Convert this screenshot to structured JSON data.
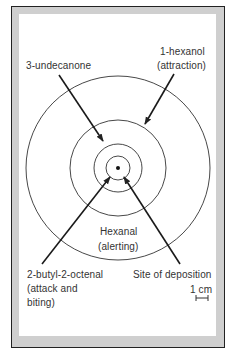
{
  "diagram": {
    "center": {
      "x": 118,
      "y": 168
    },
    "circle_radii": [
      12,
      24,
      48,
      92
    ],
    "colors": {
      "frame_band": "#cfcfcf",
      "frame_line": "#222222",
      "stroke": "#333333",
      "background": "#ffffff"
    },
    "labels": {
      "undecanone": "3-undecanone",
      "hexanol": "1-hexanol",
      "hexanol_effect": "(attraction)",
      "hexanal": "Hexanal",
      "hexanal_effect": "(alerting)",
      "butyloctenal": "2-butyl-2-octenal",
      "butyloctenal_effect_1": "(attack and",
      "butyloctenal_effect_2": "biting)",
      "site": "Site of deposition",
      "scale": "1 cm"
    },
    "arrows": [
      {
        "name": "3-undecanone",
        "from": [
          59,
          75
        ],
        "to": [
          103,
          141
        ]
      },
      {
        "name": "1-hexanol",
        "from": [
          174,
          74
        ],
        "to": [
          145,
          124
        ]
      },
      {
        "name": "2-butyl-2-octenal",
        "from": [
          42,
          264
        ],
        "to": [
          110,
          177
        ]
      },
      {
        "name": "site-of-deposition",
        "from": [
          180,
          264
        ],
        "to": [
          124,
          177
        ]
      }
    ]
  }
}
